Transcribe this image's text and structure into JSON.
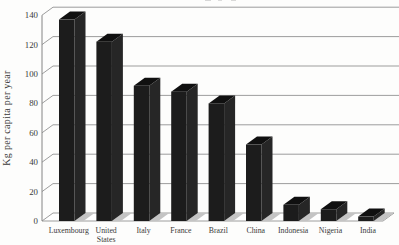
{
  "figure": {
    "background": "#fdfdfc",
    "text_color": "#3a3a3a"
  },
  "chart_data": {
    "type": "bar",
    "style": "3d-oblique-columns",
    "title": "",
    "ylabel": "Kg per capita per year",
    "xlabel": "",
    "categories": [
      "Luxembourg",
      "United\nStates",
      "Italy",
      "France",
      "Brazil",
      "China",
      "Indonesia",
      "Nigeria",
      "India"
    ],
    "values": [
      137,
      122,
      92,
      88,
      80,
      52,
      11,
      8,
      3
    ],
    "ylim": [
      0,
      140
    ],
    "yticks": [
      0,
      20,
      40,
      60,
      80,
      100,
      120,
      140
    ],
    "grid": true,
    "legend_position": "none",
    "bar_front_color": "#1c1c1c",
    "bar_top_color": "#101010",
    "bar_side_color": "#262626",
    "grid_color": "#929292",
    "axis_color": "#848484",
    "floor_fill": "#ffffff",
    "shadow_color": "#c4c4c4"
  }
}
